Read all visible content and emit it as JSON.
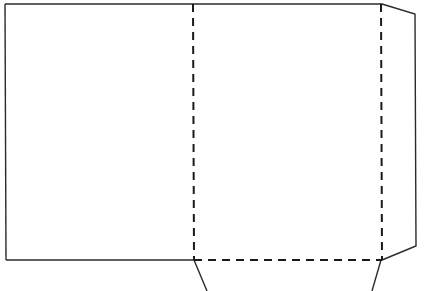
{
  "diagram": {
    "type": "folder-template-dieline",
    "colors": {
      "background": "#ffffff",
      "stroke": "#2a2a2a"
    },
    "panels": [
      {
        "name": "back-cover",
        "x1": 5,
        "y1": 4,
        "x2": 193,
        "y2": 260
      },
      {
        "name": "front-cover",
        "x1": 193,
        "y1": 4,
        "x2": 382,
        "y2": 260
      }
    ],
    "cut_lines": [
      {
        "name": "top-edge",
        "points": "5,4 382,4"
      },
      {
        "name": "left-edge",
        "points": "5,4 6,260"
      },
      {
        "name": "bottom-left-edge",
        "points": "6,260 194,260"
      },
      {
        "name": "right-flap",
        "points": "382,4 415,14 416,246 382,260"
      },
      {
        "name": "bottom-flap-left",
        "points": "194,260 207,291"
      },
      {
        "name": "bottom-flap-right",
        "points": "381,260 372,291"
      }
    ],
    "fold_lines": [
      {
        "name": "spine-fold",
        "points": "193,4 194,260"
      },
      {
        "name": "right-flap-fold",
        "points": "381,4 382,260"
      },
      {
        "name": "bottom-flap-fold",
        "points": "194,260 382,260"
      }
    ]
  }
}
